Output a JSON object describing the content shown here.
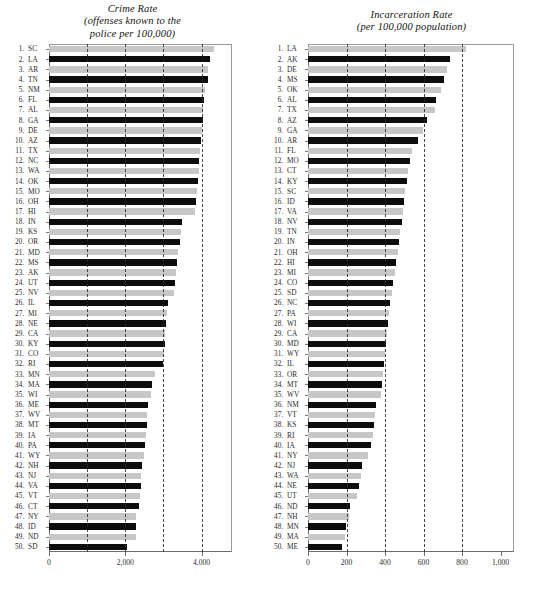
{
  "figure": {
    "artifact_text": "ws"
  },
  "chart_data": [
    {
      "type": "bar",
      "orientation": "horizontal",
      "title": "Crime Rate",
      "subtitle": "(offenses known to the\npolice per 100,000)",
      "title_line1": "Crime Rate",
      "title_line2": "(offenses known to the",
      "title_line3": "police per 100,000)",
      "xlabel": "",
      "ylabel": "",
      "xlim": [
        0,
        4800
      ],
      "xticks": [
        0,
        2000,
        4000
      ],
      "xticklabels": [
        "0",
        "2,000",
        "4,000"
      ],
      "gridlines": [
        1000,
        2000,
        3000,
        4000
      ],
      "grid": true,
      "legend": "none",
      "bar_colors": [
        "#c7c7c7",
        "#0d0d0d"
      ],
      "categories": [
        "SC",
        "LA",
        "AR",
        "TN",
        "NM",
        "FL",
        "AL",
        "GA",
        "DE",
        "AZ",
        "TX",
        "NC",
        "WA",
        "OK",
        "MO",
        "OH",
        "HI",
        "IN",
        "KS",
        "OR",
        "MD",
        "MS",
        "AK",
        "UT",
        "NV",
        "IL",
        "MI",
        "NE",
        "CA",
        "KY",
        "CO",
        "RI",
        "MN",
        "MA",
        "WI",
        "ME",
        "WV",
        "MT",
        "IA",
        "PA",
        "WY",
        "NH",
        "NJ",
        "VA",
        "VT",
        "CT",
        "NY",
        "ID",
        "ND",
        "SD"
      ],
      "ranks": [
        1,
        2,
        3,
        4,
        5,
        6,
        7,
        8,
        9,
        10,
        11,
        12,
        13,
        14,
        15,
        16,
        17,
        18,
        19,
        20,
        21,
        22,
        23,
        24,
        25,
        26,
        27,
        28,
        29,
        30,
        31,
        32,
        33,
        34,
        35,
        36,
        37,
        38,
        39,
        40,
        41,
        42,
        43,
        44,
        45,
        46,
        47,
        48,
        49,
        50
      ],
      "values": [
        4330,
        4220,
        4180,
        4175,
        4090,
        4075,
        4050,
        4030,
        4010,
        3990,
        3960,
        3945,
        3930,
        3910,
        3880,
        3865,
        3840,
        3500,
        3470,
        3430,
        3390,
        3370,
        3340,
        3310,
        3290,
        3130,
        3100,
        3070,
        3050,
        3030,
        3010,
        2990,
        2790,
        2700,
        2680,
        2590,
        2580,
        2570,
        2540,
        2520,
        2500,
        2440,
        2420,
        2400,
        2390,
        2370,
        2290,
        2280,
        2270,
        2040
      ]
    },
    {
      "type": "bar",
      "orientation": "horizontal",
      "title": "Incarceration Rate",
      "subtitle": "(per 100,000 population)",
      "title_line1": "Incarceration Rate",
      "title_line2": "(per 100,000 population)",
      "xlabel": "",
      "ylabel": "",
      "xlim": [
        0,
        1070
      ],
      "xticks": [
        0,
        200,
        400,
        600,
        800,
        1000
      ],
      "xticklabels": [
        "0",
        "200",
        "400",
        "600",
        "800",
        "1,000"
      ],
      "gridlines": [
        200,
        400,
        600,
        800
      ],
      "grid": true,
      "legend": "none",
      "bar_colors": [
        "#c7c7c7",
        "#0d0d0d"
      ],
      "categories": [
        "LA",
        "AK",
        "DE",
        "MS",
        "OK",
        "AL",
        "TX",
        "AZ",
        "GA",
        "AR",
        "FL",
        "MO",
        "CT",
        "KY",
        "SC",
        "ID",
        "VA",
        "NV",
        "TN",
        "IN",
        "OH",
        "HI",
        "MI",
        "CO",
        "SD",
        "NC",
        "PA",
        "WI",
        "CA",
        "MD",
        "WY",
        "IL",
        "OR",
        "MT",
        "WV",
        "NM",
        "VT",
        "KS",
        "RI",
        "IA",
        "NY",
        "NJ",
        "WA",
        "NE",
        "UT",
        "ND",
        "NH",
        "MN",
        "MA",
        "ME"
      ],
      "ranks": [
        1,
        2,
        3,
        4,
        5,
        6,
        7,
        8,
        9,
        10,
        11,
        12,
        13,
        14,
        15,
        16,
        17,
        18,
        19,
        20,
        21,
        22,
        23,
        24,
        25,
        26,
        27,
        28,
        29,
        30,
        31,
        32,
        33,
        34,
        35,
        36,
        37,
        38,
        39,
        40,
        41,
        42,
        43,
        44,
        45,
        46,
        47,
        48,
        49,
        50
      ],
      "values": [
        820,
        740,
        720,
        705,
        690,
        665,
        660,
        620,
        595,
        570,
        540,
        530,
        520,
        515,
        505,
        500,
        495,
        490,
        480,
        475,
        465,
        455,
        450,
        440,
        435,
        425,
        420,
        415,
        410,
        405,
        400,
        395,
        390,
        385,
        380,
        355,
        350,
        345,
        340,
        325,
        310,
        280,
        275,
        265,
        255,
        220,
        215,
        195,
        190,
        175
      ]
    }
  ]
}
